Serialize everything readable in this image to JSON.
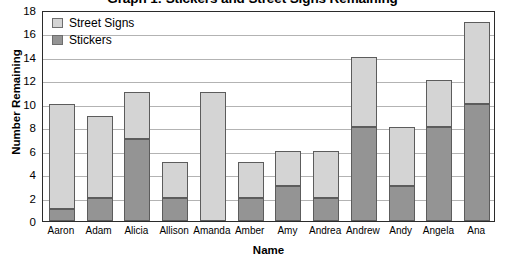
{
  "chart_data": {
    "type": "bar",
    "subtype": "stacked-vertical",
    "title": "Graph 1: Stickers and Street Signs Remaining",
    "xlabel": "Name",
    "ylabel": "Number Remaining",
    "ylim": [
      0,
      18
    ],
    "ytick_step": 2,
    "yticks": [
      18,
      16,
      14,
      12,
      10,
      8,
      6,
      4,
      2,
      0
    ],
    "grid": true,
    "grid_axis": "y",
    "legend_position": "top-left-inside",
    "categories": [
      "Aaron",
      "Adam",
      "Alicia",
      "Allison",
      "Amanda",
      "Amber",
      "Amy",
      "Andrea",
      "Andrew",
      "Andy",
      "Angela",
      "Ana"
    ],
    "series": [
      {
        "name": "Stickers",
        "color": "#949494",
        "values": [
          1,
          2,
          7,
          2,
          0,
          2,
          3,
          2,
          8,
          3,
          8,
          10
        ]
      },
      {
        "name": "Street Signs",
        "color": "#d4d4d4",
        "values": [
          9,
          7,
          4,
          3,
          11,
          3,
          3,
          4,
          6,
          5,
          4,
          7
        ]
      }
    ],
    "totals": [
      10,
      9,
      11,
      5,
      11,
      5,
      6,
      6,
      14,
      8,
      12,
      17
    ],
    "stack_order": [
      "Stickers",
      "Street Signs"
    ]
  },
  "legend": {
    "entries": [
      {
        "label": "Street Signs",
        "color": "#d4d4d4"
      },
      {
        "label": "Stickers",
        "color": "#949494"
      }
    ]
  },
  "colors": {
    "street_signs": "#d4d4d4",
    "stickers": "#949494",
    "gridline": "#b3b3b3",
    "axis": "#2b2b2b",
    "bar_outline": "#5c5c5c",
    "text": "#000000",
    "background": "#ffffff"
  }
}
